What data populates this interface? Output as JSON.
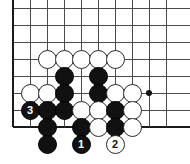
{
  "diagram": {
    "kind": "go-board-problem",
    "board": {
      "origin_x": 13,
      "origin_y": 8,
      "spacing": 17,
      "cols": 10,
      "rows": 8,
      "line_color": "#4a4a4a",
      "edge_color": "#1a1a1a",
      "background": "#ffffff",
      "left_edge_col": 0,
      "bottom_edge_row": 7,
      "right_visible_col": 9,
      "top_visible_row": 0
    },
    "star_points": [
      {
        "name": "hoshi-right",
        "col": 8,
        "row": 5
      }
    ],
    "stones": [
      {
        "name": "white-stone",
        "color": "white",
        "col": 2,
        "row": 3,
        "label": ""
      },
      {
        "name": "white-stone",
        "color": "white",
        "col": 3,
        "row": 3,
        "label": ""
      },
      {
        "name": "white-stone",
        "color": "white",
        "col": 4,
        "row": 3,
        "label": ""
      },
      {
        "name": "white-stone",
        "color": "white",
        "col": 5,
        "row": 3,
        "label": ""
      },
      {
        "name": "white-stone",
        "color": "white",
        "col": 6,
        "row": 3,
        "label": ""
      },
      {
        "name": "black-stone",
        "color": "black",
        "col": 3,
        "row": 4,
        "label": ""
      },
      {
        "name": "black-stone",
        "color": "black",
        "col": 5,
        "row": 4,
        "label": ""
      },
      {
        "name": "white-stone",
        "color": "white",
        "col": 1,
        "row": 5,
        "label": ""
      },
      {
        "name": "white-stone",
        "color": "white",
        "col": 2,
        "row": 5,
        "label": ""
      },
      {
        "name": "black-stone",
        "color": "black",
        "col": 3,
        "row": 5,
        "label": ""
      },
      {
        "name": "black-stone",
        "color": "black",
        "col": 5,
        "row": 5,
        "label": ""
      },
      {
        "name": "white-stone",
        "color": "white",
        "col": 6,
        "row": 5,
        "label": ""
      },
      {
        "name": "white-stone",
        "color": "white",
        "col": 7,
        "row": 5,
        "label": ""
      },
      {
        "name": "black-stone-move-3",
        "color": "black",
        "col": 1,
        "row": 6,
        "label": "3"
      },
      {
        "name": "black-stone",
        "color": "black",
        "col": 2,
        "row": 6,
        "label": ""
      },
      {
        "name": "black-stone",
        "color": "black",
        "col": 3,
        "row": 6,
        "label": ""
      },
      {
        "name": "white-stone",
        "color": "white",
        "col": 4,
        "row": 6,
        "label": ""
      },
      {
        "name": "white-stone",
        "color": "white",
        "col": 5,
        "row": 6,
        "label": ""
      },
      {
        "name": "black-stone",
        "color": "black",
        "col": 6,
        "row": 6,
        "label": ""
      },
      {
        "name": "white-stone",
        "color": "white",
        "col": 7,
        "row": 6,
        "label": ""
      },
      {
        "name": "black-stone",
        "color": "black",
        "col": 2,
        "row": 7,
        "label": ""
      },
      {
        "name": "black-stone",
        "color": "black",
        "col": 4,
        "row": 7,
        "label": ""
      },
      {
        "name": "white-stone",
        "color": "white",
        "col": 5,
        "row": 7,
        "label": ""
      },
      {
        "name": "black-stone",
        "color": "black",
        "col": 6,
        "row": 7,
        "label": ""
      },
      {
        "name": "white-stone",
        "color": "white",
        "col": 7,
        "row": 7,
        "label": ""
      },
      {
        "name": "black-stone",
        "color": "black",
        "col": 2,
        "row": 8,
        "label": ""
      },
      {
        "name": "black-stone-move-1",
        "color": "black",
        "col": 4,
        "row": 8,
        "label": "1"
      },
      {
        "name": "white-stone-move-2",
        "color": "white",
        "col": 6,
        "row": 8,
        "label": "2"
      }
    ],
    "move_labels": {
      "move_1": "1",
      "move_2": "2",
      "move_3": "3"
    },
    "colors": {
      "black_stone": "#111111",
      "white_stone": "#ffffff",
      "stone_outline": "#2a2a2a",
      "grid": "#4a4a4a",
      "board_edge": "#1a1a1a"
    }
  }
}
